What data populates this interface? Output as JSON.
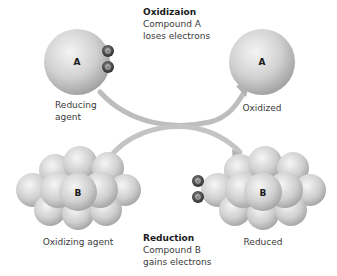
{
  "diagram": {
    "type": "redox-reaction",
    "oxidation": {
      "title": "Oxidizaion",
      "line1": "Compound A",
      "line2": "loses electrons"
    },
    "reduction": {
      "title": "Reduction",
      "line1": "Compound B",
      "line2": "gains electrons"
    },
    "nodes": {
      "a_before": {
        "letter": "A",
        "label_line1": "Reducing",
        "label_line2": "agent"
      },
      "a_after": {
        "letter": "A",
        "label": "Oxidized"
      },
      "b_before": {
        "letter": "B",
        "label": "Oxidizing agent"
      },
      "b_after": {
        "letter": "B",
        "label": "Reduced"
      }
    },
    "electron_symbol": "e",
    "colors": {
      "sphere_light": "#eeeeee",
      "sphere_dark": "#9a9a9a",
      "arrow": "#b8b8b8",
      "electron": "#3c3c3c"
    }
  }
}
